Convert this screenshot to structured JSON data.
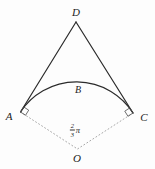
{
  "figure": {
    "background": "#fdfdfd",
    "solid_color": "#2b2b2b",
    "dotted_color": "#9e9e9e",
    "marker_color": "#4a4a4a",
    "text_color": "#1c1c1c"
  },
  "labels": {
    "D": "D",
    "B": "B",
    "A": "A",
    "C": "C",
    "O": "O"
  },
  "angle": {
    "numerator": "2",
    "denominator": "3",
    "symbol": "π"
  },
  "points": {
    "A": [
      20.5,
      112
    ],
    "C": [
      133,
      113
    ],
    "D": [
      76,
      22
    ],
    "O": [
      77.5,
      149
    ]
  },
  "arc": {
    "radius": 67
  },
  "right_angle_marker_size": 6
}
